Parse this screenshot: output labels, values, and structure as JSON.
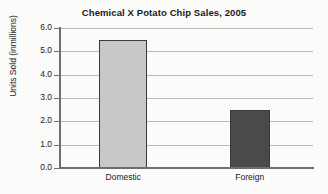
{
  "chart_data": {
    "type": "bar",
    "title": "Chemical X Potato Chip Sales, 2005",
    "xlabel": "",
    "ylabel": "Units Sold (inmillions)",
    "categories": [
      "Domestic",
      "Foreign"
    ],
    "values": [
      5.5,
      2.5
    ],
    "ylim": [
      0.0,
      6.0
    ],
    "yticks": [
      "0.0",
      "1.0",
      "2.0",
      "3.0",
      "4.0",
      "5.0",
      "6.0"
    ],
    "ytick_values": [
      0.0,
      1.0,
      2.0,
      3.0,
      4.0,
      5.0,
      6.0
    ],
    "grid": "horizontal",
    "legend": "none",
    "bar_colors": [
      "#c8c8c8",
      "#4a4a4a"
    ],
    "bar_edge_color": "#3a3a3a",
    "background_color": "#fbfbfa",
    "axis_color": "#6e6e6e",
    "gridline_color": "#b9b9b9",
    "text_color": "#1a1a1a"
  }
}
